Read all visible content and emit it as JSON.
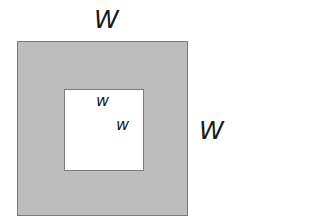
{
  "diagram": {
    "outer_square": {
      "fill": "#bdbdbd",
      "border": "#7a7a7a",
      "width_label": "W",
      "height_label": "W"
    },
    "inner_square": {
      "fill": "#ffffff",
      "border": "#7a7a7a",
      "width_label": "w",
      "height_label": "w"
    }
  }
}
